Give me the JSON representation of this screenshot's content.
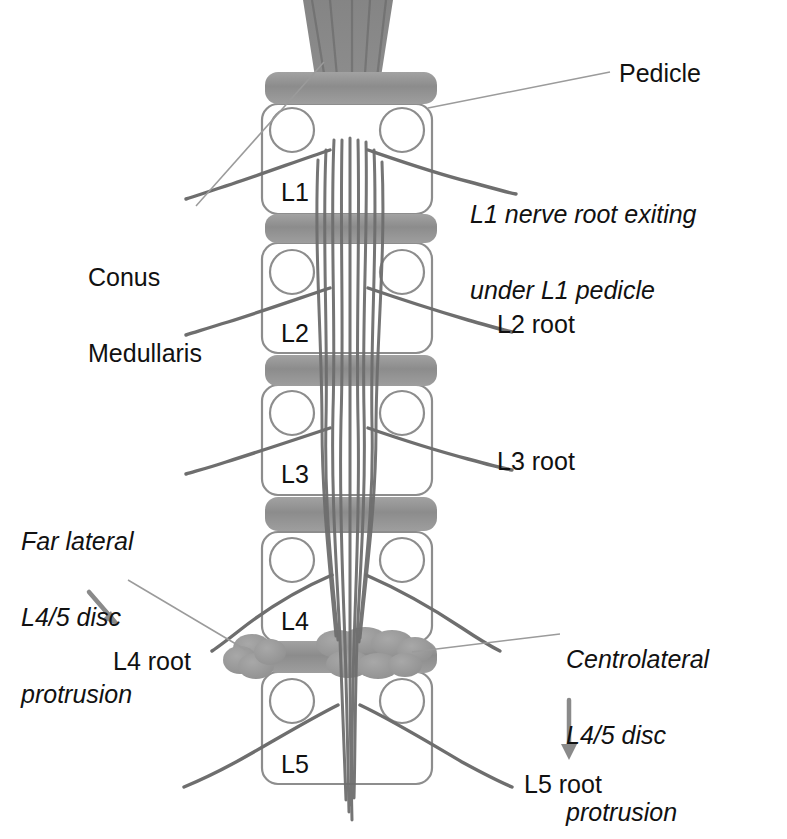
{
  "figure": {
    "kind": "lumbar-spine-nerve-root-anatomy-diagram",
    "palette": {
      "bone_outline": "#8d8d8d",
      "disc_fill": "#8f8f8f",
      "nerve": "#6e6e6e",
      "conus": "#7d7d7d",
      "protrusion": "#9a9a9a",
      "leader": "#9b9b9b",
      "arrow": "#8a8a8a",
      "text": "#111111",
      "background": "#ffffff"
    }
  },
  "vertebrae": [
    {
      "id": "L1",
      "label": "L1"
    },
    {
      "id": "L2",
      "label": "L2"
    },
    {
      "id": "L3",
      "label": "L3"
    },
    {
      "id": "L4",
      "label": "L4"
    },
    {
      "id": "L5",
      "label": "L5"
    }
  ],
  "callouts": {
    "pedicle": {
      "label": "Pedicle",
      "style": "plain"
    },
    "l1_nerve_root": {
      "line1": "L1 nerve root exiting",
      "line2": "under L1 pedicle",
      "style": "italic"
    },
    "conus_medullaris": {
      "line1": "Conus",
      "line2": "Medullaris",
      "style": "plain"
    },
    "far_lateral": {
      "line1": "Far lateral",
      "line2": "L4/5 disc",
      "line3": "protrusion",
      "style": "italic"
    },
    "centrolateral": {
      "line1": "Centrolateral",
      "line2": "L4/5 disc",
      "line3": "protrusion",
      "style": "italic"
    }
  },
  "root_labels": [
    {
      "id": "l2-root",
      "label": "L2 root"
    },
    {
      "id": "l3-root",
      "label": "L3 root"
    },
    {
      "id": "l4-root",
      "label": "L4 root"
    },
    {
      "id": "l5-root",
      "label": "L5 root"
    }
  ]
}
